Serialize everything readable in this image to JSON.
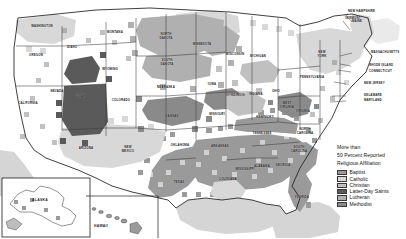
{
  "map": {
    "title": "United States Religious Affiliation by County",
    "legend": {
      "title": "More than\n50 Percent Reported\nReligious Affiliation",
      "title_line1": "More than",
      "title_line2": "50 Percent Reported",
      "title_line3": "Religious Affiliation",
      "items": [
        {
          "label": "Baptist",
          "color": "#9a9a9a"
        },
        {
          "label": "Catholic",
          "color": "#d8d8d8"
        },
        {
          "label": "Christian",
          "color": "#c0c0c0"
        },
        {
          "label": "Latter-Day Saints",
          "color": "#5a5a5a"
        },
        {
          "label": "Lutheran",
          "color": "#b0b0b0"
        },
        {
          "label": "Methodist",
          "color": "#8a8a8a"
        }
      ]
    },
    "colors": {
      "background": "#ffffff",
      "land_unshaded": "#ffffff",
      "water": "#d5d5d5",
      "border": "#2a2a2a",
      "state_border": "#3a3a3a",
      "baptist": "#9a9a9a",
      "catholic": "#d8d8d8",
      "christian": "#c0c0c0",
      "latter_day_saints": "#5a5a5a",
      "lutheran": "#b0b0b0",
      "methodist": "#8a8a8a"
    },
    "states": [
      {
        "name": "WASHINGTON",
        "x": 42,
        "y": 27
      },
      {
        "name": "OREGON",
        "x": 36,
        "y": 56
      },
      {
        "name": "CALIFORNIA",
        "x": 28,
        "y": 104
      },
      {
        "name": "NEVADA",
        "x": 57,
        "y": 92
      },
      {
        "name": "IDAHO",
        "x": 72,
        "y": 48
      },
      {
        "name": "MONTANA",
        "x": 115,
        "y": 33
      },
      {
        "name": "WYOMING",
        "x": 110,
        "y": 70
      },
      {
        "name": "UTAH",
        "x": 81,
        "y": 97
      },
      {
        "name": "COLORADO",
        "x": 121,
        "y": 101
      },
      {
        "name": "ARIZONA",
        "x": 86,
        "y": 149
      },
      {
        "name": "NEW\nMEXICO",
        "x": 128,
        "y": 150
      },
      {
        "name": "NORTH\nDAKOTA",
        "x": 166,
        "y": 37
      },
      {
        "name": "SOUTH\nDAKOTA",
        "x": 167,
        "y": 63
      },
      {
        "name": "NEBRASKA",
        "x": 166,
        "y": 88
      },
      {
        "name": "KANSAS",
        "x": 172,
        "y": 117
      },
      {
        "name": "OKLAHOMA",
        "x": 180,
        "y": 146
      },
      {
        "name": "TEXAS",
        "x": 179,
        "y": 183
      },
      {
        "name": "MINNESOTA",
        "x": 202,
        "y": 45
      },
      {
        "name": "IOWA",
        "x": 212,
        "y": 85
      },
      {
        "name": "MISSOURI",
        "x": 217,
        "y": 115
      },
      {
        "name": "ARKANSAS",
        "x": 220,
        "y": 147
      },
      {
        "name": "LOUISIANA",
        "x": 228,
        "y": 180
      },
      {
        "name": "WISCONSIN",
        "x": 235,
        "y": 55
      },
      {
        "name": "ILLINOIS",
        "x": 238,
        "y": 96
      },
      {
        "name": "MISSISSIPPI",
        "x": 245,
        "y": 170
      },
      {
        "name": "MICHIGAN",
        "x": 258,
        "y": 57
      },
      {
        "name": "INDIANA",
        "x": 256,
        "y": 95
      },
      {
        "name": "KENTUCKY",
        "x": 265,
        "y": 118
      },
      {
        "name": "TENNESSEE",
        "x": 262,
        "y": 134
      },
      {
        "name": "ALABAMA",
        "x": 262,
        "y": 167
      },
      {
        "name": "OHIO",
        "x": 276,
        "y": 92
      },
      {
        "name": "GEORGIA",
        "x": 283,
        "y": 166
      },
      {
        "name": "FLORIDA",
        "x": 302,
        "y": 198
      },
      {
        "name": "WEST\nVIRGINIA",
        "x": 287,
        "y": 106
      },
      {
        "name": "SOUTH\nCAROLINA",
        "x": 299,
        "y": 150
      },
      {
        "name": "NORTH\nCAROLINA",
        "x": 305,
        "y": 132
      },
      {
        "name": "VIRGINIA",
        "x": 303,
        "y": 112
      },
      {
        "name": "PENNSYLVANIA",
        "x": 312,
        "y": 78
      },
      {
        "name": "NEW\nYORK",
        "x": 322,
        "y": 55
      },
      {
        "name": "MAINE",
        "x": 357,
        "y": 22
      }
    ],
    "callout_labels": [
      {
        "name": "NEW HAMPSHIRE",
        "x": 348,
        "y": 12
      },
      {
        "name": "VERMONT",
        "x": 345,
        "y": 19
      },
      {
        "name": "MASSACHUSETTS",
        "x": 371,
        "y": 53
      },
      {
        "name": "RHODE ISLAND",
        "x": 369,
        "y": 66
      },
      {
        "name": "CONNECTICUT",
        "x": 369,
        "y": 72
      },
      {
        "name": "NEW JERSEY",
        "x": 364,
        "y": 84
      },
      {
        "name": "DELAWARE",
        "x": 364,
        "y": 96
      },
      {
        "name": "MARYLAND",
        "x": 364,
        "y": 101
      }
    ],
    "insets": [
      {
        "name": "ALASKA",
        "label": "ALASKA",
        "x": 40,
        "y": 200
      },
      {
        "name": "HAWAII",
        "label": "HAWAII",
        "x": 101,
        "y": 226
      }
    ]
  }
}
